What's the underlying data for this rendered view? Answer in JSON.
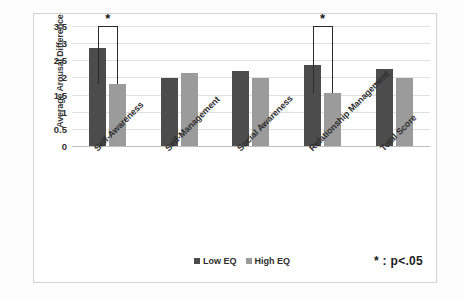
{
  "chart_data": {
    "type": "bar",
    "title": "",
    "xlabel": "",
    "ylabel": "Average Arousal Difference",
    "ylim": [
      0,
      3.5
    ],
    "yticks": [
      "0",
      "0.5",
      "1",
      "1.5",
      "2",
      "2.5",
      "3",
      "3.5"
    ],
    "grid": true,
    "legend_position": "bottom-center",
    "categories": [
      "Self-Awareness",
      "Self-Management",
      "Social Awareness",
      "Relationship Management",
      "Total Score"
    ],
    "series": [
      {
        "name": "Low EQ",
        "color": "#4c4c4c",
        "values": [
          2.87,
          1.99,
          2.2,
          2.35,
          2.25
        ]
      },
      {
        "name": "High EQ",
        "color": "#9b9b9b",
        "values": [
          1.81,
          2.13,
          1.98,
          1.56,
          1.97
        ]
      }
    ],
    "annotations": [
      {
        "type": "significance-bracket",
        "category": "Self-Awareness",
        "marker": "*",
        "top_value": 3.5
      },
      {
        "type": "significance-bracket",
        "category": "Relationship Management",
        "marker": "*",
        "top_value": 3.5
      }
    ],
    "footnote": "*  :  p<.05"
  }
}
